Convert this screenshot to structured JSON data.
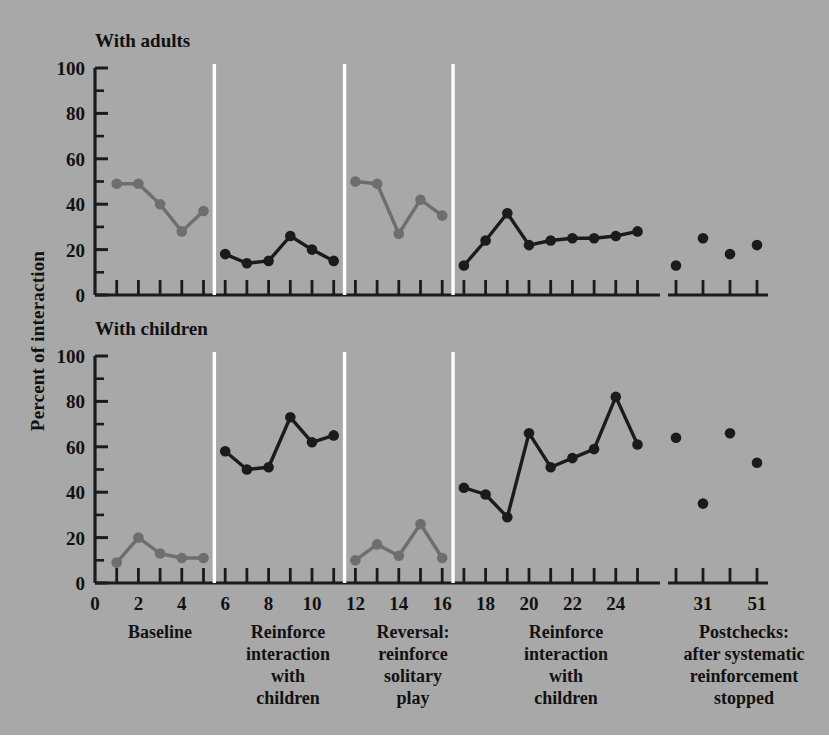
{
  "figure": {
    "background_color": "#a8a8a8",
    "y_axis_label": "Percent of interaction",
    "panels": [
      {
        "id": "adults",
        "title": "With adults"
      },
      {
        "id": "children",
        "title": "With children"
      }
    ],
    "phase_captions": [
      {
        "id": "baseline",
        "lines": [
          "Baseline"
        ]
      },
      {
        "id": "reinforce-1",
        "lines": [
          "Reinforce",
          "interaction",
          "with",
          "children"
        ]
      },
      {
        "id": "reversal",
        "lines": [
          "Reversal:",
          "reinforce",
          "solitary",
          "play"
        ]
      },
      {
        "id": "reinforce-2",
        "lines": [
          "Reinforce",
          "interaction",
          "with",
          "children"
        ]
      },
      {
        "id": "postchecks",
        "lines": [
          "Postchecks:",
          "after systematic",
          "reinforcement",
          "stopped"
        ]
      }
    ]
  },
  "chart_data": [
    {
      "id": "with-adults",
      "type": "line",
      "title": "With adults",
      "xlabel": "",
      "ylabel": "Percent of interaction",
      "ylim": [
        0,
        100
      ],
      "yticks": [
        0,
        20,
        40,
        60,
        80,
        100
      ],
      "yminorticks": [
        10,
        30,
        50,
        70,
        90
      ],
      "xlim": [
        0,
        26
      ],
      "xticks": [
        0,
        2,
        4,
        6,
        8,
        10,
        12,
        14,
        16,
        18,
        20,
        22,
        24
      ],
      "xminorticks": [
        1,
        3,
        5,
        7,
        9,
        11,
        13,
        15,
        17,
        19,
        21,
        23,
        25
      ],
      "grid": false,
      "legend": "none",
      "phase_lines_x": [
        5.5,
        11.5,
        16.5
      ],
      "series": [
        {
          "name": "Baseline",
          "color": "#6e6e6e",
          "marker": "circle",
          "x": [
            1,
            2,
            3,
            4,
            5
          ],
          "values": [
            49,
            49,
            40,
            28,
            37
          ]
        },
        {
          "name": "Reinforce interaction with children",
          "color": "#1b1b1b",
          "marker": "circle",
          "x": [
            6,
            7,
            8,
            9,
            10,
            11
          ],
          "values": [
            18,
            14,
            15,
            26,
            20,
            15
          ]
        },
        {
          "name": "Reversal: reinforce solitary play",
          "color": "#6e6e6e",
          "marker": "circle",
          "x": [
            12,
            13,
            14,
            15,
            16
          ],
          "values": [
            50,
            49,
            27,
            42,
            35
          ]
        },
        {
          "name": "Reinforce interaction with children (2)",
          "color": "#1b1b1b",
          "marker": "circle",
          "x": [
            17,
            18,
            19,
            20,
            21,
            22,
            23,
            24,
            25
          ],
          "values": [
            13,
            24,
            36,
            22,
            24,
            25,
            25,
            26,
            28
          ]
        },
        {
          "name": "Postchecks",
          "color": "#1b1b1b",
          "marker": "circle",
          "line": "none",
          "x": [
            29,
            31,
            45,
            51
          ],
          "values": [
            13,
            25,
            18,
            22
          ]
        }
      ]
    },
    {
      "id": "with-children",
      "type": "line",
      "title": "With children",
      "xlabel": "",
      "ylabel": "Percent of interaction",
      "ylim": [
        0,
        100
      ],
      "yticks": [
        0,
        20,
        40,
        60,
        80,
        100
      ],
      "yminorticks": [
        10,
        30,
        50,
        70,
        90
      ],
      "xlim": [
        0,
        26
      ],
      "xticks": [
        0,
        2,
        4,
        6,
        8,
        10,
        12,
        14,
        16,
        18,
        20,
        22,
        24
      ],
      "xminorticks": [
        1,
        3,
        5,
        7,
        9,
        11,
        13,
        15,
        17,
        19,
        21,
        23,
        25
      ],
      "grid": false,
      "legend": "none",
      "phase_lines_x": [
        5.5,
        11.5,
        16.5
      ],
      "series": [
        {
          "name": "Baseline",
          "color": "#6e6e6e",
          "marker": "circle",
          "x": [
            1,
            2,
            3,
            4,
            5
          ],
          "values": [
            9,
            20,
            13,
            11,
            11
          ]
        },
        {
          "name": "Reinforce interaction with children",
          "color": "#1b1b1b",
          "marker": "circle",
          "x": [
            6,
            7,
            8,
            9,
            10,
            11
          ],
          "values": [
            58,
            50,
            51,
            73,
            62,
            65
          ]
        },
        {
          "name": "Reversal: reinforce solitary play",
          "color": "#6e6e6e",
          "marker": "circle",
          "x": [
            12,
            13,
            14,
            15,
            16
          ],
          "values": [
            10,
            17,
            12,
            26,
            11
          ]
        },
        {
          "name": "Reinforce interaction with children (2)",
          "color": "#1b1b1b",
          "marker": "circle",
          "x": [
            17,
            18,
            19,
            20,
            21,
            22,
            23,
            24,
            25
          ],
          "values": [
            42,
            39,
            29,
            66,
            51,
            55,
            59,
            82,
            61
          ]
        },
        {
          "name": "Postchecks",
          "color": "#1b1b1b",
          "marker": "circle",
          "line": "none",
          "x": [
            29,
            31,
            45,
            51
          ],
          "values": [
            64,
            35,
            66,
            53
          ]
        }
      ]
    }
  ],
  "x_axis": {
    "labels": [
      "0",
      "2",
      "4",
      "6",
      "8",
      "10",
      "12",
      "14",
      "16",
      "18",
      "20",
      "22",
      "24"
    ],
    "postcheck_labels": [
      "31",
      "51"
    ]
  },
  "y_axis": {
    "labels": [
      "100",
      "80",
      "60",
      "40",
      "20",
      "0"
    ]
  }
}
